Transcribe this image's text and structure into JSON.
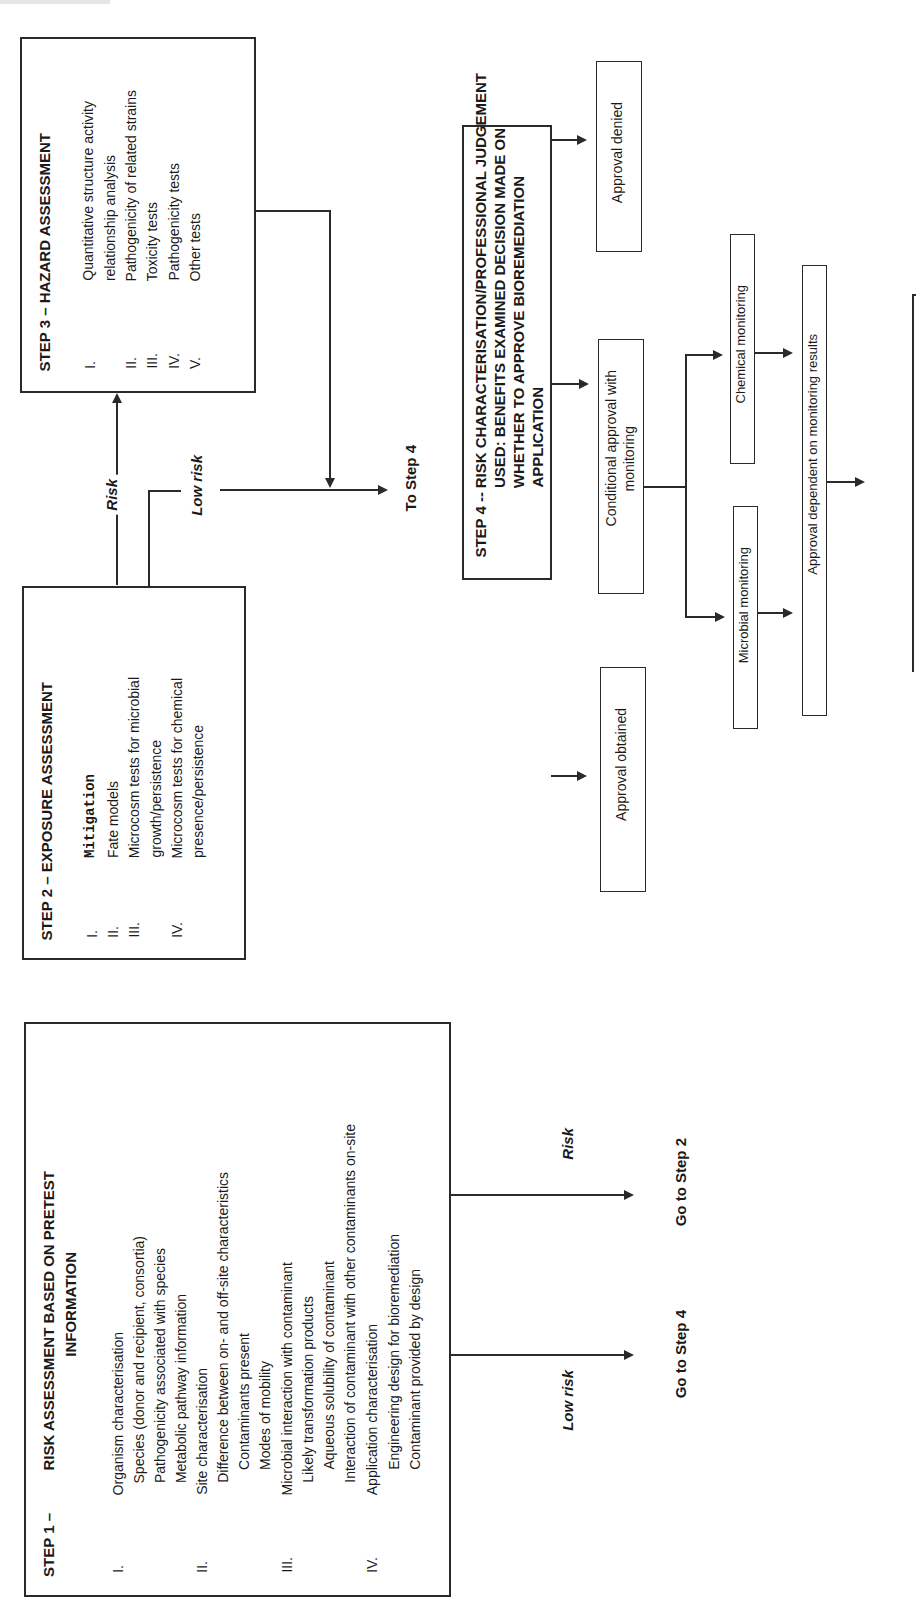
{
  "step1": {
    "label": "STEP 1 –",
    "title_line1": "RISK ASSESSMENT BASED ON PRETEST",
    "title_line2": "INFORMATION",
    "sections": [
      {
        "numeral": "I.",
        "heading": "Organism characterisation",
        "items": [
          "Species (donor and recipient, consortia)",
          "Pathogenicity associated with species",
          "Metabolic pathway information"
        ]
      },
      {
        "numeral": "II.",
        "heading": "Site characterisation",
        "items": [
          "Difference between on- and off-site characteristics",
          "Contaminants present",
          "Modes of mobility"
        ]
      },
      {
        "numeral": "III.",
        "heading": "Microbial interaction with contaminant",
        "items": [
          "Likely transformation products",
          "Aqueous solubility of contaminant",
          "Interaction of contaminant with other contaminants on-site"
        ]
      },
      {
        "numeral": "IV.",
        "heading": "Application characterisation",
        "items": [
          "Engineering design for bioremediation",
          "Contaminant provided by design"
        ]
      }
    ],
    "branch_low_risk": "Low risk",
    "branch_risk": "Risk",
    "goto_low": "Go to Step 4",
    "goto_risk": "Go to Step 2"
  },
  "step2": {
    "title": "STEP 2 – EXPOSURE ASSESSMENT",
    "items": [
      {
        "numeral": "I.",
        "lines": [
          "Mitigation"
        ],
        "mono": true
      },
      {
        "numeral": "II.",
        "lines": [
          "Fate models"
        ]
      },
      {
        "numeral": "III.",
        "lines": [
          "Microcosm tests for microbial",
          "growth/persistence"
        ]
      },
      {
        "numeral": "IV.",
        "lines": [
          "Microcosm tests for chemical",
          "presence/persistence"
        ]
      }
    ],
    "branch_risk": "Risk",
    "branch_low_risk": "Low risk",
    "to_step4": "To Step 4"
  },
  "step3": {
    "title": "STEP 3 – HAZARD ASSESSMENT",
    "items": [
      {
        "numeral": "I.",
        "lines": [
          "Quantitative structure activity",
          "relationship analysis"
        ]
      },
      {
        "numeral": "II.",
        "lines": [
          "Pathogenicity of related strains"
        ]
      },
      {
        "numeral": "III.",
        "lines": [
          "Toxicity tests"
        ]
      },
      {
        "numeral": "IV.",
        "lines": [
          "Pathogenicity tests"
        ]
      },
      {
        "numeral": "V.",
        "lines": [
          "Other tests"
        ]
      }
    ]
  },
  "step4": {
    "label": "STEP 4 --",
    "title_lines": [
      "RISK CHARACTERISATION/PROFESSIONAL JUDGEMENT",
      "USED: BENEFITS EXAMINED DECISION MADE ON",
      "WHETHER TO APPROVE BIOREMEDIATION",
      "APPLICATION"
    ]
  },
  "outcomes": {
    "approval_denied": "Approval denied",
    "conditional_line1": "Conditional approval with",
    "conditional_line2": "monitoring",
    "approval_obtained": "Approval obtained",
    "chemical_monitoring": "Chemical monitoring",
    "microbial_monitoring": "Microbial monitoring",
    "approval_dependent": "Approval dependent on monitoring results"
  }
}
